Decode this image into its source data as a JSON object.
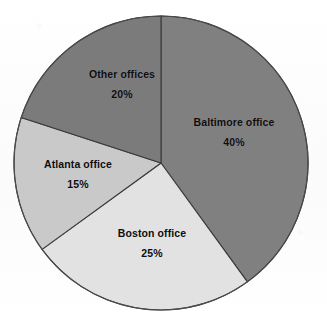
{
  "chart_data": {
    "type": "pie",
    "title": "",
    "subtitle": "",
    "xlabel": "",
    "ylabel": "",
    "legend_position": "none",
    "grid": false,
    "labels_inside_slices": true,
    "start_angle_deg": 0,
    "direction": "clockwise",
    "categories": [
      "Baltimore office",
      "Boston office",
      "Atlanta office",
      "Other offices"
    ],
    "values": [
      40,
      25,
      15,
      20
    ],
    "value_unit": "%",
    "slices": [
      {
        "name": "Baltimore office",
        "value": 40,
        "percent_label": "40%",
        "angle_deg": 144,
        "color": "#808080",
        "label_x": 234,
        "label_y": 132
      },
      {
        "name": "Boston office",
        "value": 25,
        "percent_label": "25%",
        "angle_deg": 90,
        "color": "#e2e2e2",
        "label_x": 152,
        "label_y": 243
      },
      {
        "name": "Atlanta office",
        "value": 15,
        "percent_label": "15%",
        "angle_deg": 54,
        "color": "#c9c9c9",
        "label_x": 78,
        "label_y": 174
      },
      {
        "name": "Other offices",
        "value": 20,
        "percent_label": "20%",
        "angle_deg": 72,
        "color": "#7b7b7b",
        "label_x": 122,
        "label_y": 84
      }
    ],
    "geometry": {
      "center_x": 161,
      "center_y": 163,
      "radius": 147
    },
    "colors": {
      "background": "#fdfdfd",
      "outline": "#4a4a4a",
      "label_text": "#0d0d0d"
    }
  }
}
